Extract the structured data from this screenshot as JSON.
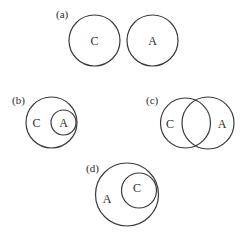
{
  "colors": {
    "stroke": "#3a3a3a",
    "text": "#2a2a2a",
    "background": "#ffffff"
  },
  "panels": [
    {
      "id": "a",
      "label": "(a)",
      "relationship": "disjoint",
      "label_pos": [
        56,
        18
      ],
      "sets": [
        {
          "name": "C",
          "cx": 94.5,
          "cy": 40.5,
          "r": 25.5,
          "label_pos": [
            94.5,
            45
          ]
        },
        {
          "name": "A",
          "cx": 152.5,
          "cy": 40.5,
          "r": 25.5,
          "label_pos": [
            152.5,
            45
          ]
        }
      ]
    },
    {
      "id": "b",
      "label": "(b)",
      "relationship": "A subset of C",
      "label_pos": [
        12,
        104
      ],
      "sets": [
        {
          "name": "C",
          "cx": 51.5,
          "cy": 122.5,
          "r": 25.5,
          "label_pos": [
            36.5,
            127
          ]
        },
        {
          "name": "A",
          "cx": 63.5,
          "cy": 122.5,
          "r": 12.5,
          "label_pos": [
            63.5,
            127
          ]
        }
      ]
    },
    {
      "id": "c",
      "label": "(c)",
      "relationship": "overlapping",
      "label_pos": [
        146,
        104
      ],
      "sets": [
        {
          "name": "C",
          "cx": 185.5,
          "cy": 123,
          "r": 25,
          "label_pos": [
            170,
            127.5
          ]
        },
        {
          "name": "A",
          "cx": 208,
          "cy": 123,
          "r": 26,
          "label_pos": [
            222,
            127.5
          ]
        }
      ]
    },
    {
      "id": "d",
      "label": "(d)",
      "relationship": "C subset of A",
      "label_pos": [
        86,
        172
      ],
      "sets": [
        {
          "name": "A",
          "cx": 127,
          "cy": 194.5,
          "r": 31.5,
          "label_pos": [
            107,
            203
          ]
        },
        {
          "name": "C",
          "cx": 139,
          "cy": 190.5,
          "r": 17.5,
          "label_pos": [
            137,
            192
          ]
        }
      ]
    }
  ]
}
